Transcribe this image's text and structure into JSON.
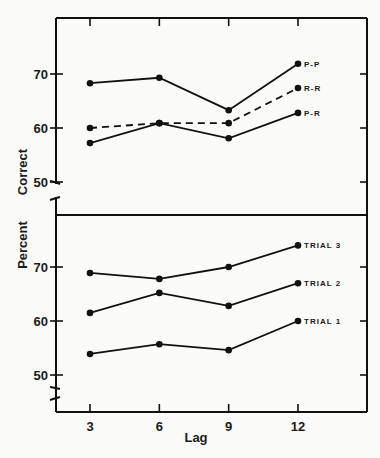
{
  "chart_data": [
    {
      "type": "line",
      "panel": "upper",
      "title": "",
      "xlabel": "Lag",
      "ylabel": "Percent Correct",
      "x": [
        3,
        6,
        9,
        12
      ],
      "yticks": [
        50,
        60,
        70
      ],
      "ylim": [
        48,
        78
      ],
      "grid": false,
      "legend_position": "inline-right",
      "series": [
        {
          "name": "P-P",
          "style": "solid",
          "values": [
            68.3,
            69.3,
            63.3,
            71.9
          ]
        },
        {
          "name": "R-R",
          "style": "dashed",
          "values": [
            60.0,
            60.9,
            60.9,
            67.4
          ]
        },
        {
          "name": "P-R",
          "style": "solid",
          "values": [
            57.2,
            60.9,
            58.1,
            62.8
          ]
        }
      ]
    },
    {
      "type": "line",
      "panel": "lower",
      "title": "",
      "xlabel": "Lag",
      "ylabel": "Percent Correct",
      "x": [
        3,
        6,
        9,
        12
      ],
      "yticks": [
        50,
        60,
        70
      ],
      "ylim": [
        48,
        78
      ],
      "grid": false,
      "legend_position": "inline-right",
      "series": [
        {
          "name": "TRIAL 3",
          "style": "solid",
          "values": [
            68.9,
            67.8,
            70.0,
            74.0
          ]
        },
        {
          "name": "TRIAL 2",
          "style": "solid",
          "values": [
            61.5,
            65.2,
            62.8,
            67.0
          ]
        },
        {
          "name": "TRIAL 1",
          "style": "solid",
          "values": [
            53.9,
            55.7,
            54.6,
            60.0
          ]
        }
      ]
    }
  ],
  "labels": {
    "xlabel": "Lag",
    "ylabel_lower_word": "Percent",
    "ylabel_upper_word": "Correct",
    "xticks": [
      "3",
      "6",
      "9",
      "12"
    ],
    "yticks": [
      "50",
      "60",
      "70"
    ]
  }
}
